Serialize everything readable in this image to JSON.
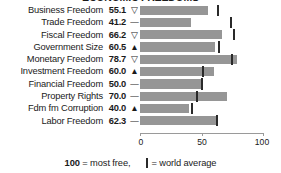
{
  "title": "ECONOMIC FREEDOMS",
  "chart_data": {
    "type": "bar",
    "title": "ECONOMIC FREEDOMS",
    "xlabel": "",
    "ylabel": "",
    "xlim": [
      0,
      100
    ],
    "grid": false,
    "orientation": "horizontal",
    "categories": [
      "Business Freedom",
      "Trade Freedom",
      "Fiscal Freedom",
      "Government Size",
      "Monetary Freedom",
      "Investment Freedom",
      "Financial Freedom",
      "Property Rights",
      "Fdm fm Corruption",
      "Labor Freedom"
    ],
    "values": [
      55.1,
      41.2,
      66.2,
      60.5,
      78.7,
      60.0,
      50.0,
      70.0,
      40.0,
      62.3
    ],
    "trends": [
      "down",
      "flat",
      "down",
      "up",
      "down",
      "up",
      "flat",
      "flat",
      "up",
      "flat"
    ],
    "trend_glyphs": [
      "▽",
      "—",
      "▽",
      "▲",
      "▽",
      "▲",
      "—",
      "—",
      "▲",
      "—"
    ],
    "world_average": [
      62.0,
      72.5,
      75.0,
      63.0,
      74.0,
      50.0,
      49.5,
      45.0,
      41.0,
      61.5
    ],
    "ticks": [
      0,
      50,
      100
    ],
    "tick_labels": [
      "0",
      "50",
      "100"
    ],
    "bar_color": "#969696",
    "marker_color": "#2a2a2a"
  },
  "rows": [
    {
      "label": "Business Freedom",
      "value": "55.1",
      "glyph": "▽"
    },
    {
      "label": "Trade Freedom",
      "value": "41.2",
      "glyph": "—"
    },
    {
      "label": "Fiscal Freedom",
      "value": "66.2",
      "glyph": "▽"
    },
    {
      "label": "Government Size",
      "value": "60.5",
      "glyph": "▲"
    },
    {
      "label": "Monetary Freedom",
      "value": "78.7",
      "glyph": "▽"
    },
    {
      "label": "Investment Freedom",
      "value": "60.0",
      "glyph": "▲"
    },
    {
      "label": "Financial Freedom",
      "value": "50.0",
      "glyph": "—"
    },
    {
      "label": "Property Rights",
      "value": "70.0",
      "glyph": "—"
    },
    {
      "label": "Fdm fm Corruption",
      "value": "40.0",
      "glyph": "▲"
    },
    {
      "label": "Labor Freedom",
      "value": "62.3",
      "glyph": "—"
    }
  ],
  "axis": {
    "tick_labels": [
      "0",
      "50",
      "100"
    ]
  },
  "legend": {
    "max_value": "100",
    "max_text": "= most free,",
    "average_text": "= world average"
  }
}
